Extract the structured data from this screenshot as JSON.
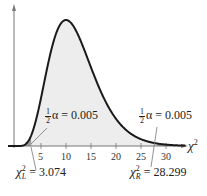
{
  "chart_data": {
    "type": "line",
    "title": "",
    "xlabel": "χ²",
    "ylabel": "",
    "xlim": [
      0,
      35
    ],
    "xticks": [
      5,
      10,
      15,
      20,
      25,
      30
    ],
    "grid": false,
    "series": [
      {
        "name": "chi-square density (df = 12)",
        "df": 12,
        "shaded": true
      }
    ],
    "annotations": [
      {
        "text": "½α = 0.005",
        "position": "left tail",
        "x": 3.074
      },
      {
        "text": "½α = 0.005",
        "position": "right tail",
        "x": 28.299
      }
    ],
    "critical_values": {
      "left": {
        "label": "χ²_L",
        "value": "3.074"
      },
      "right": {
        "label": "χ²_R",
        "value": "28.299"
      }
    }
  },
  "labels": {
    "x_axis": "χ",
    "x_axis_sup": "2",
    "ticks": [
      "5",
      "10",
      "15",
      "20",
      "25",
      "30"
    ],
    "half": {
      "num": "1",
      "den": "2"
    },
    "alpha_left": "α = 0.005",
    "alpha_right": "α = 0.005",
    "chi_left": "χ",
    "chi_left_sup": "2",
    "chi_left_sub": "L",
    "chi_left_value": " = 3.074",
    "chi_right": "χ",
    "chi_right_sup": "2",
    "chi_right_sub": "R",
    "chi_right_value": " = 28.299"
  },
  "colors": {
    "curve": "#1a1a1a",
    "fill": "#ededed",
    "tail": "#9a9a9a",
    "axis": "#666666"
  }
}
